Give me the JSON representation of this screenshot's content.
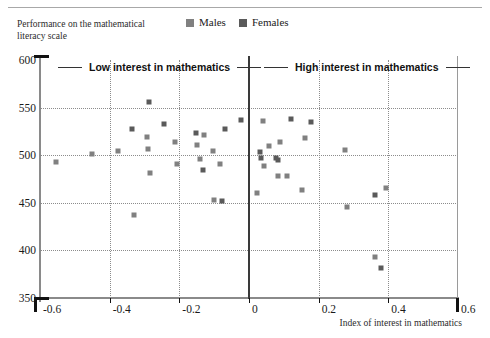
{
  "legend": {
    "items": [
      {
        "label": "Males",
        "color": "#808080"
      },
      {
        "label": "Females",
        "color": "#5a5a5a"
      }
    ]
  },
  "annotations": {
    "low": "Low interest in mathematics",
    "high": "High interest in mathematics"
  },
  "chart_data": {
    "type": "scatter",
    "title": "",
    "ylabel": "Performance on the mathematical literacy scale",
    "xlabel": "Index of interest in mathematics",
    "xlim": [
      -0.6,
      0.6
    ],
    "ylim": [
      350,
      600
    ],
    "xticks": [
      "-0.6",
      "-0.4",
      "-0.2",
      "0",
      "0.2",
      "0.4",
      "0.6"
    ],
    "xtick_values": [
      -0.6,
      -0.4,
      -0.2,
      0,
      0.2,
      0.4,
      0.6
    ],
    "yticks": [
      "600",
      "550",
      "500",
      "450",
      "400",
      "350"
    ],
    "ytick_values": [
      600,
      550,
      500,
      450,
      400,
      350
    ],
    "grid": true,
    "legend_position": "top-center",
    "series": [
      {
        "name": "Males",
        "color": "#808080",
        "points": [
          {
            "x": -0.555,
            "y": 493
          },
          {
            "x": -0.452,
            "y": 501
          },
          {
            "x": -0.375,
            "y": 504
          },
          {
            "x": -0.33,
            "y": 437
          },
          {
            "x": -0.293,
            "y": 519
          },
          {
            "x": -0.29,
            "y": 507
          },
          {
            "x": -0.283,
            "y": 481
          },
          {
            "x": -0.213,
            "y": 514
          },
          {
            "x": -0.208,
            "y": 491
          },
          {
            "x": -0.148,
            "y": 511
          },
          {
            "x": -0.142,
            "y": 496
          },
          {
            "x": -0.128,
            "y": 521
          },
          {
            "x": -0.103,
            "y": 504
          },
          {
            "x": -0.1,
            "y": 453
          },
          {
            "x": -0.083,
            "y": 491
          },
          {
            "x": 0.022,
            "y": 460
          },
          {
            "x": 0.04,
            "y": 536
          },
          {
            "x": 0.043,
            "y": 489
          },
          {
            "x": 0.058,
            "y": 510
          },
          {
            "x": 0.082,
            "y": 478
          },
          {
            "x": 0.09,
            "y": 514
          },
          {
            "x": 0.108,
            "y": 478
          },
          {
            "x": 0.152,
            "y": 463
          },
          {
            "x": 0.162,
            "y": 518
          },
          {
            "x": 0.275,
            "y": 505
          },
          {
            "x": 0.28,
            "y": 446
          },
          {
            "x": 0.362,
            "y": 393
          },
          {
            "x": 0.393,
            "y": 466
          }
        ]
      },
      {
        "name": "Females",
        "color": "#5a5a5a",
        "points": [
          {
            "x": -0.288,
            "y": 556
          },
          {
            "x": -0.337,
            "y": 528
          },
          {
            "x": -0.245,
            "y": 533
          },
          {
            "x": -0.152,
            "y": 523
          },
          {
            "x": -0.133,
            "y": 484
          },
          {
            "x": -0.07,
            "y": 527
          },
          {
            "x": -0.078,
            "y": 452
          },
          {
            "x": -0.023,
            "y": 537
          },
          {
            "x": 0.032,
            "y": 503
          },
          {
            "x": 0.035,
            "y": 497
          },
          {
            "x": 0.077,
            "y": 497
          },
          {
            "x": 0.083,
            "y": 495
          },
          {
            "x": 0.12,
            "y": 538
          },
          {
            "x": 0.178,
            "y": 535
          },
          {
            "x": 0.362,
            "y": 458
          },
          {
            "x": 0.378,
            "y": 381
          }
        ]
      }
    ]
  }
}
